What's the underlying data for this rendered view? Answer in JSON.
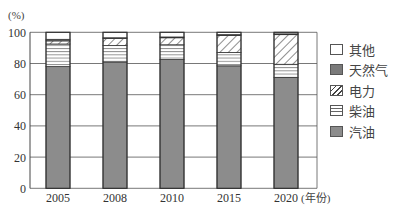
{
  "chart_data": {
    "type": "bar",
    "stacked": true,
    "title": "",
    "ylabel": "(%)",
    "xlabel": "(年份)",
    "ylim": [
      0,
      100
    ],
    "yticks": [
      0,
      20,
      40,
      60,
      80,
      100
    ],
    "grid": true,
    "legend_position": "right",
    "categories": [
      "2005",
      "2008",
      "2010",
      "2015",
      "2020"
    ],
    "series": [
      {
        "name": "汽油",
        "values": [
          78,
          81,
          82.5,
          78.5,
          71
        ],
        "fill": "#8c8c8c",
        "pattern": "solid"
      },
      {
        "name": "柴油",
        "values": [
          14.5,
          10.5,
          9.5,
          8.5,
          8.5
        ],
        "fill": "#ffffff",
        "pattern": "horizontal"
      },
      {
        "name": "电力",
        "values": [
          2,
          4.5,
          4.5,
          11,
          19
        ],
        "fill": "#ffffff",
        "pattern": "diagonal"
      },
      {
        "name": "天然气",
        "values": [
          1,
          0.5,
          0.5,
          0.5,
          0.5
        ],
        "fill": "#7a7a7a",
        "pattern": "solid"
      },
      {
        "name": "其他",
        "values": [
          4.5,
          3.5,
          3,
          1.5,
          1
        ],
        "fill": "#ffffff",
        "pattern": "solid"
      }
    ]
  },
  "legend": [
    {
      "label": "其他",
      "key": "other"
    },
    {
      "label": "天然气",
      "key": "gas"
    },
    {
      "label": "电力",
      "key": "elec"
    },
    {
      "label": "柴油",
      "key": "diesel"
    },
    {
      "label": "汽油",
      "key": "gasoline"
    }
  ],
  "axis": {
    "y_unit": "(%)",
    "x_unit": "(年份)"
  }
}
